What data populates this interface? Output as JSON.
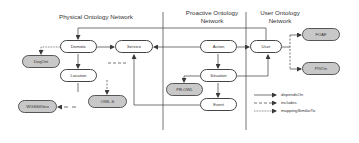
{
  "sections": {
    "physical": {
      "title": "Physical Ontology Network"
    },
    "proactive": {
      "title_line1": "Proactive Ontology",
      "title_line2": "Network"
    },
    "user": {
      "title_line1": "User Ontology",
      "title_line2": "Network"
    }
  },
  "nodes": {
    "domotic": {
      "label": "Domotic",
      "style": "white"
    },
    "service": {
      "label": "Service",
      "style": "white"
    },
    "location": {
      "label": "Location",
      "style": "white"
    },
    "dogont": {
      "label": "DogOnt",
      "style": "gray"
    },
    "owls": {
      "label": "OWL-S",
      "style": "gray"
    },
    "wgs84geo": {
      "label": "WGS84Geo",
      "style": "gray"
    },
    "action": {
      "label": "Action",
      "style": "white"
    },
    "situation": {
      "label": "Situation",
      "style": "white"
    },
    "event": {
      "label": "Event",
      "style": "white"
    },
    "prowl": {
      "label": "PR-OWL",
      "style": "gray"
    },
    "user": {
      "label": "User",
      "style": "white"
    },
    "foaf": {
      "label": "FOAF",
      "style": "gray"
    },
    "pivon": {
      "label": "PIVOn",
      "style": "gray"
    }
  },
  "edges": [
    {
      "from": "Domotic",
      "to": "Service",
      "type": "dependsOn"
    },
    {
      "from": "Domotic",
      "to": "Location",
      "type": "dependsOn"
    },
    {
      "from": "Domotic",
      "to": "DogOnt",
      "type": "mappingSimilarTo"
    },
    {
      "from": "Action",
      "to": "Service",
      "type": "dependsOn"
    },
    {
      "from": "Action",
      "to": "Situation",
      "type": "dependsOn"
    },
    {
      "from": "Action",
      "to": "User",
      "type": "dependsOn"
    },
    {
      "from": "Situation",
      "to": "Event",
      "type": "dependsOn"
    },
    {
      "from": "Situation",
      "to": "User",
      "type": "dependsOn"
    },
    {
      "from": "Situation",
      "to": "PR-OWL",
      "type": "dependsOn"
    },
    {
      "from": "Event",
      "to": "Service",
      "type": "dependsOn"
    },
    {
      "from": "User",
      "to": "Domotic",
      "type": "dependsOn"
    },
    {
      "from": "User",
      "to": "FOAF",
      "type": "includes"
    },
    {
      "from": "User",
      "to": "PIVOn",
      "type": "includes"
    },
    {
      "from": "Service",
      "to": "OWL-S",
      "type": "includes"
    },
    {
      "from": "Location",
      "to": "WGS84Geo",
      "type": "includes"
    }
  ],
  "legend": {
    "items": [
      {
        "label": "dependsOn",
        "line": "solid"
      },
      {
        "label": "includes",
        "line": "dashed"
      },
      {
        "label": "mappingSimilarTo",
        "line": "dotted"
      }
    ]
  },
  "colors": {
    "line": "#3a3a3a",
    "gray_node": "#c8c8c8",
    "white_node": "#ffffff"
  }
}
